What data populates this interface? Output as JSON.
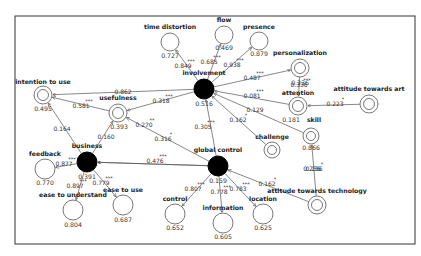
{
  "diagram": {
    "type": "structural-equation-model",
    "frame": {
      "x": 15,
      "y": 16,
      "w": 400,
      "h": 228
    },
    "nodes": [
      {
        "id": "involvement",
        "label": "involvement",
        "value": "0.516",
        "kind": "latent-filled",
        "x": 204,
        "y": 89,
        "r": 10,
        "label_dx": 0,
        "label_dy": -14,
        "value_dx": 0,
        "value_dy": 17
      },
      {
        "id": "global_control",
        "label": "global control",
        "value": "0.159",
        "kind": "latent-filled",
        "x": 218,
        "y": 166,
        "r": 10,
        "label_dx": 0,
        "label_dy": -14,
        "value_dx": 0,
        "value_dy": 17
      },
      {
        "id": "business",
        "label": "business",
        "value": "0.391",
        "kind": "latent-filled",
        "x": 87,
        "y": 162,
        "r": 10,
        "label_dx": 0,
        "label_dy": -14,
        "value_dx": 0,
        "value_dy": 17
      },
      {
        "id": "time_distortion",
        "label": "time distortion",
        "value": "0.727",
        "kind": "single",
        "x": 170,
        "y": 42,
        "r": 9,
        "label_dx": 0,
        "label_dy": -13,
        "value_dx": 0,
        "value_dy": 16
      },
      {
        "id": "flow",
        "label": "flow",
        "value": "0.469",
        "kind": "single",
        "x": 224,
        "y": 35,
        "r": 9,
        "label_dx": 0,
        "label_dy": -13,
        "value_dx": 0,
        "value_dy": 15
      },
      {
        "id": "presence",
        "label": "presence",
        "value": "0.879",
        "kind": "single",
        "x": 259,
        "y": 41,
        "r": 9,
        "label_dx": 0,
        "label_dy": -12,
        "value_dx": 0,
        "value_dy": 15
      },
      {
        "id": "personalization",
        "label": "personalization",
        "value": "0.336",
        "kind": "double",
        "x": 300,
        "y": 68,
        "r": 9,
        "label_dx": 0,
        "label_dy": -13,
        "value_dx": 0,
        "value_dy": 17
      },
      {
        "id": "attention",
        "label": "attention",
        "value": "0.181",
        "kind": "double",
        "x": 298,
        "y": 106,
        "r": 9,
        "label_dx": 0,
        "label_dy": -11,
        "value_dx": -7,
        "value_dy": 16
      },
      {
        "id": "attitude_art",
        "label": "attitude towards art",
        "value": "",
        "kind": "double",
        "x": 369,
        "y": 104,
        "r": 9,
        "label_dx": 0,
        "label_dy": -13,
        "value_dx": 0,
        "value_dy": 0
      },
      {
        "id": "skill",
        "label": "skill",
        "value": "0.866",
        "kind": "double",
        "x": 311,
        "y": 136,
        "r": 8,
        "label_dx": 3,
        "label_dy": -14,
        "value_dx": 0,
        "value_dy": 14
      },
      {
        "id": "challenge",
        "label": "challenge",
        "value": "",
        "kind": "double",
        "x": 272,
        "y": 150,
        "r": 8,
        "label_dx": 0,
        "label_dy": -11,
        "value_dx": 0,
        "value_dy": 0
      },
      {
        "id": "attitude_tech",
        "label": "attitude towards technology",
        "value": "0.236",
        "kind": "double",
        "x": 317,
        "y": 205,
        "r": 9,
        "label_dx": 0,
        "label_dy": -12,
        "value_dx": -5,
        "value_dy": -34
      },
      {
        "id": "intention_to_use",
        "label": "intention to use",
        "value": "0.495",
        "kind": "double",
        "x": 43,
        "y": 95,
        "r": 9,
        "label_dx": 0,
        "label_dy": -11,
        "value_dx": 0,
        "value_dy": 16
      },
      {
        "id": "usefulness",
        "label": "usefulness",
        "value": "0.393",
        "kind": "double",
        "x": 118,
        "y": 113,
        "r": 9,
        "label_dx": 0,
        "label_dy": -13,
        "value_dx": 1,
        "value_dy": 16
      },
      {
        "id": "feedback",
        "label": "feedback",
        "value": "0.770",
        "kind": "single",
        "x": 45,
        "y": 169,
        "r": 10,
        "label_dx": 0,
        "label_dy": -13,
        "value_dx": 0,
        "value_dy": 16
      },
      {
        "id": "ease_understand",
        "label": "ease to understand",
        "value": "0.804",
        "kind": "single",
        "x": 73,
        "y": 210,
        "r": 10,
        "label_dx": 0,
        "label_dy": -13,
        "value_dx": 0,
        "value_dy": 17
      },
      {
        "id": "ease_use",
        "label": "ease to use",
        "value": "0.687",
        "kind": "single",
        "x": 123,
        "y": 205,
        "r": 10,
        "label_dx": 0,
        "label_dy": -13,
        "value_dx": 0,
        "value_dy": 17
      },
      {
        "id": "control",
        "label": "control",
        "value": "0.652",
        "kind": "single",
        "x": 175,
        "y": 214,
        "r": 10,
        "label_dx": 0,
        "label_dy": -13,
        "value_dx": 0,
        "value_dy": 16
      },
      {
        "id": "information",
        "label": "information",
        "value": "0.605",
        "kind": "single",
        "x": 223,
        "y": 223,
        "r": 10,
        "label_dx": 0,
        "label_dy": -13,
        "value_dx": 0,
        "value_dy": 16
      },
      {
        "id": "location",
        "label": "location",
        "value": "0.625",
        "kind": "single",
        "x": 263,
        "y": 214,
        "r": 10,
        "label_dx": 0,
        "label_dy": -13,
        "value_dx": 0,
        "value_dy": 16
      }
    ],
    "edges": [
      {
        "from": "involvement",
        "to": "time_distortion",
        "coef": "0.849",
        "sig": "***",
        "lx": 183,
        "ly": 68
      },
      {
        "from": "involvement",
        "to": "flow",
        "coef": "0.685",
        "sig": "***",
        "lx": 209,
        "ly": 64
      },
      {
        "from": "involvement",
        "to": "presence",
        "coef": "0.938",
        "sig": "***",
        "lx": 232,
        "ly": 67
      },
      {
        "from": "involvement",
        "to": "personalization",
        "coef": "0.487",
        "sig": "***",
        "lx": 252,
        "ly": 80
      },
      {
        "from": "attention",
        "to": "involvement",
        "coef": "0.081",
        "sig": "***",
        "lx": 252,
        "ly": 98
      },
      {
        "from": "skill",
        "to": "involvement",
        "coef": "0.129",
        "sig": "",
        "lx": 255,
        "ly": 112
      },
      {
        "from": "challenge",
        "to": "involvement",
        "coef": "0.162",
        "sig": "*",
        "lx": 238,
        "ly": 122
      },
      {
        "from": "global_control",
        "to": "involvement",
        "coef": "0.305",
        "sig": "***",
        "lx": 203,
        "ly": 129
      },
      {
        "from": "involvement",
        "to": "usefulness",
        "coef": "0.318",
        "sig": "***",
        "lx": 161,
        "ly": 103
      },
      {
        "from": "involvement",
        "to": "intention_to_use",
        "coef": "0.862",
        "sig": "",
        "lx": 123,
        "ly": 94
      },
      {
        "from": "usefulness",
        "to": "intention_to_use",
        "coef": "0.581",
        "sig": "***",
        "lx": 81,
        "ly": 108
      },
      {
        "from": "business",
        "to": "intention_to_use",
        "coef": "0.164",
        "sig": "",
        "lx": 62,
        "ly": 131
      },
      {
        "from": "business",
        "to": "usefulness",
        "coef": "0.160",
        "sig": "",
        "lx": 106,
        "ly": 139
      },
      {
        "from": "global_control",
        "to": "usefulness",
        "coef": "0.270",
        "sig": "**",
        "lx": 144,
        "ly": 127
      },
      {
        "from": "global_control",
        "to": "business",
        "coef": "0.316",
        "sig": "*",
        "lx": 163,
        "ly": 141
      },
      {
        "from": "global_control",
        "to": "business",
        "coef": "0.476",
        "sig": "***",
        "lx": 155,
        "ly": 163
      },
      {
        "from": "business",
        "to": "feedback",
        "coef": "0.877",
        "sig": "***",
        "lx": 64,
        "ly": 166
      },
      {
        "from": "business",
        "to": "ease_understand",
        "coef": "0.897",
        "sig": "***",
        "lx": 75,
        "ly": 188
      },
      {
        "from": "business",
        "to": "ease_use",
        "coef": "0.779",
        "sig": "***",
        "lx": 101,
        "ly": 185
      },
      {
        "from": "global_control",
        "to": "control",
        "coef": "0.807",
        "sig": "***",
        "lx": 193,
        "ly": 191
      },
      {
        "from": "global_control",
        "to": "information",
        "coef": "0.778",
        "sig": "***",
        "lx": 219,
        "ly": 194
      },
      {
        "from": "global_control",
        "to": "location",
        "coef": "0.783",
        "sig": "***",
        "lx": 238,
        "ly": 191
      },
      {
        "from": "attitude_tech",
        "to": "global_control",
        "coef": "0.162",
        "sig": "*",
        "lx": 267,
        "ly": 186
      },
      {
        "from": "personalization",
        "to": "attention",
        "coef": "0.336",
        "sig": "***",
        "lx": null,
        "ly": null
      },
      {
        "from": "attitude_art",
        "to": "attention",
        "coef": "0.223",
        "sig": "*",
        "lx": 335,
        "ly": 106
      },
      {
        "from": "attitude_tech",
        "to": "skill",
        "coef": "0.236",
        "sig": "*",
        "lx": null,
        "ly": null
      }
    ]
  },
  "texts": {
    "involvement": "involvement",
    "global_control": "global control",
    "business": "business"
  }
}
